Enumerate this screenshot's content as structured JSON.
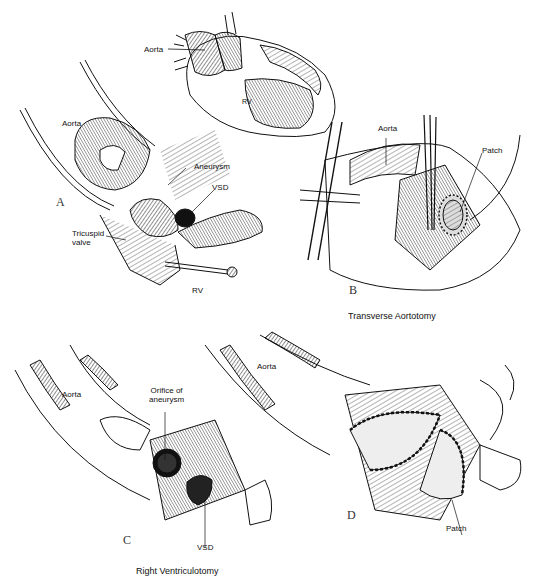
{
  "figure": {
    "panels": [
      {
        "id": "A",
        "letter": "A",
        "labels": {
          "inset_aorta": "Aorta",
          "inset_rv": "RV",
          "aorta": "Aorta",
          "aneurysm": "Aneurysm",
          "vsd": "VSD",
          "tricuspid_line1": "Tricuspid",
          "tricuspid_line2": "valve",
          "rv": "RV"
        }
      },
      {
        "id": "B",
        "letter": "B",
        "labels": {
          "aorta": "Aorta",
          "patch": "Patch"
        },
        "caption": "Transverse Aortotomy"
      },
      {
        "id": "C",
        "letter": "C",
        "labels": {
          "aorta": "Aorta",
          "orifice_line1": "Orifice of",
          "orifice_line2": "aneurysm",
          "vsd": "VSD"
        },
        "caption": "Right Ventriculotomy"
      },
      {
        "id": "D",
        "letter": "D",
        "labels": {
          "aorta": "Aorta",
          "patch": "Patch"
        }
      }
    ]
  }
}
